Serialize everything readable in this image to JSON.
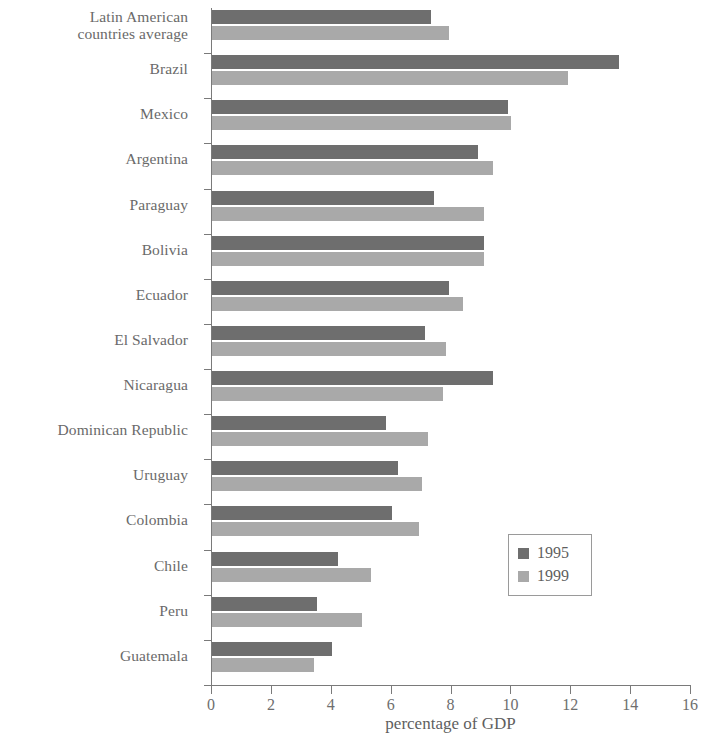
{
  "chart_data": {
    "type": "bar",
    "orientation": "horizontal",
    "title": "",
    "xlabel": "percentage of GDP",
    "ylabel": "",
    "xlim": [
      0,
      16
    ],
    "xticks": [
      0,
      2,
      4,
      6,
      8,
      10,
      12,
      14,
      16
    ],
    "xtick_labels": [
      "0",
      "2",
      "4",
      "6",
      "8",
      "10",
      "12",
      "14",
      "16"
    ],
    "grid": false,
    "legend_position": "center-right",
    "categories": [
      "Latin American\ncountries average",
      "Brazil",
      "Mexico",
      "Argentina",
      "Paraguay",
      "Bolivia",
      "Ecuador",
      "El Salvador",
      "Nicaragua",
      "Dominican Republic",
      "Uruguay",
      "Colombia",
      "Chile",
      "Peru",
      "Guatemala"
    ],
    "series": [
      {
        "name": "1995",
        "color": "#6e6e6e",
        "values": [
          7.3,
          13.6,
          9.9,
          8.9,
          7.4,
          9.1,
          7.9,
          7.1,
          9.4,
          5.8,
          6.2,
          6.0,
          4.2,
          3.5,
          4.0
        ]
      },
      {
        "name": "1999",
        "color": "#a9a9a9",
        "values": [
          7.9,
          11.9,
          10.0,
          9.4,
          9.1,
          9.1,
          8.4,
          7.8,
          7.7,
          7.2,
          7.0,
          6.9,
          5.3,
          5.0,
          3.4
        ]
      }
    ]
  },
  "legend": {
    "entries": [
      {
        "label": "1995",
        "color": "#6e6e6e"
      },
      {
        "label": "1999",
        "color": "#a9a9a9"
      }
    ]
  },
  "axis": {
    "x_title": "percentage of GDP"
  }
}
